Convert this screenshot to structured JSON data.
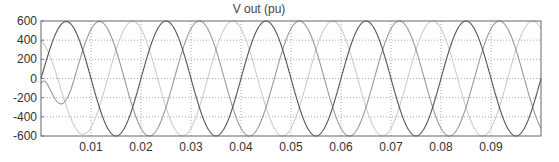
{
  "chart_data": {
    "type": "line",
    "title": "V out (pu)",
    "xlabel": "",
    "ylabel": "",
    "xlim": [
      0,
      0.1
    ],
    "ylim": [
      -600,
      600
    ],
    "xticks": [
      0.01,
      0.02,
      0.03,
      0.04,
      0.05,
      0.06,
      0.07,
      0.08,
      0.09
    ],
    "xtick_labels": [
      "0.01",
      "0.02",
      "0.03",
      "0.04",
      "0.05",
      "0.06",
      "0.07",
      "0.08",
      "0.09"
    ],
    "yticks": [
      600,
      400,
      200,
      0,
      -200,
      -400,
      -600
    ],
    "ytick_labels": [
      "600",
      "400",
      "200",
      "0",
      "-200",
      "-400",
      "-600"
    ],
    "grid": true,
    "legend": null,
    "frequency_hz": 50,
    "amplitude": 600,
    "series": [
      {
        "name": "Phase A",
        "color": "#555555",
        "phase_deg": 0,
        "peak_times": [
          0.005,
          0.025,
          0.045,
          0.065,
          0.085
        ],
        "initial_peak": 560
      },
      {
        "name": "Phase B",
        "color": "#999999",
        "phase_deg": -120,
        "peak_times": [
          0.0117,
          0.0317,
          0.0517,
          0.0717,
          0.0917
        ]
      },
      {
        "name": "Phase C",
        "color": "#cccccc",
        "phase_deg": 120,
        "peak_times": [
          0.0183,
          0.0383,
          0.0583,
          0.0783,
          0.0983
        ],
        "initial_trough": -470
      }
    ]
  }
}
